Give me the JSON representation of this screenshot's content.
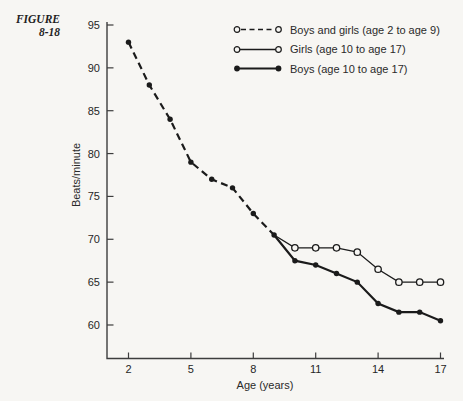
{
  "figure_label": {
    "line1": "FIGURE",
    "line2": "8-18"
  },
  "colors": {
    "paper": "#f7f6f3",
    "line": "#1b1b1b",
    "axis": "#3d3d3d",
    "text": "#262626"
  },
  "chart_data": {
    "type": "line",
    "title": "",
    "xlabel": "Age (years)",
    "ylabel": "Beats/minute",
    "xticks": [
      2,
      5,
      8,
      11,
      14,
      17
    ],
    "yticks": [
      60,
      65,
      70,
      75,
      80,
      85,
      90,
      95
    ],
    "xlim": [
      1,
      17.2
    ],
    "ylim": [
      56.5,
      95
    ],
    "grid": false,
    "legend_position": "top-right",
    "series": [
      {
        "name": "Boys and girls (age 2 to age 9)",
        "line_style": "dashed",
        "marker": "filled-circle",
        "marker_from": 0,
        "x": [
          2,
          3,
          4,
          5,
          6,
          7,
          8,
          9
        ],
        "y": [
          93,
          88,
          84,
          79,
          77,
          76,
          73,
          70.5
        ]
      },
      {
        "name": "Girls (age 10 to age 17)",
        "line_style": "solid-thin",
        "marker": "open-circle",
        "marker_from": 1,
        "x": [
          9,
          10,
          11,
          12,
          13,
          14,
          15,
          16,
          17
        ],
        "y": [
          70.5,
          69,
          69,
          69,
          68.5,
          66.5,
          65,
          65,
          65
        ]
      },
      {
        "name": "Boys (age 10 to age 17)",
        "line_style": "solid-thick",
        "marker": "filled-circle",
        "marker_from": 1,
        "x": [
          9,
          10,
          11,
          12,
          13,
          14,
          15,
          16,
          17
        ],
        "y": [
          70.5,
          67.5,
          67,
          66,
          65,
          62.5,
          61.5,
          61.5,
          60.5
        ]
      }
    ]
  }
}
